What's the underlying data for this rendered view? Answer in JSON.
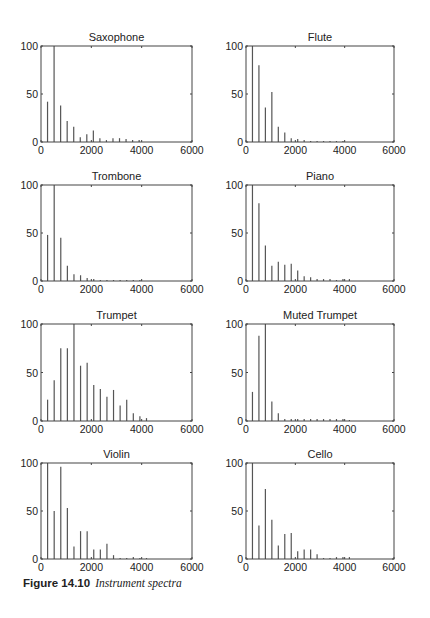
{
  "figure": {
    "caption_number": "Figure 14.10",
    "caption_text": "Instrument spectra"
  },
  "chart_data": [
    {
      "type": "bar",
      "title": "Saxophone",
      "xlabel": "",
      "ylabel": "",
      "xlim": [
        0,
        6000
      ],
      "ylim": [
        0,
        100
      ],
      "xticks": [
        0,
        2000,
        4000,
        6000
      ],
      "yticks": [
        0,
        50,
        100
      ],
      "grid": false,
      "x": [
        260,
        520,
        780,
        1040,
        1300,
        1560,
        1820,
        2080,
        2340,
        2600,
        2860,
        3120,
        3380,
        3640,
        3900
      ],
      "values": [
        42,
        100,
        38,
        22,
        16,
        5,
        8,
        12,
        4,
        2,
        4,
        4,
        3,
        2,
        2
      ]
    },
    {
      "type": "bar",
      "title": "Flute",
      "xlabel": "",
      "ylabel": "",
      "xlim": [
        0,
        6000
      ],
      "ylim": [
        0,
        100
      ],
      "xticks": [
        0,
        2000,
        4000,
        6000
      ],
      "yticks": [
        0,
        50,
        100
      ],
      "grid": false,
      "x": [
        262,
        524,
        786,
        1048,
        1310,
        1572,
        1834,
        2096,
        2358,
        2620,
        2882,
        3144,
        3406,
        3668,
        3930
      ],
      "values": [
        100,
        80,
        36,
        52,
        16,
        10,
        4,
        3,
        2,
        1,
        1,
        1,
        1,
        1,
        1
      ]
    },
    {
      "type": "bar",
      "title": "Trombone",
      "xlabel": "",
      "ylabel": "",
      "xlim": [
        0,
        6000
      ],
      "ylim": [
        0,
        100
      ],
      "xticks": [
        0,
        2000,
        4000,
        6000
      ],
      "yticks": [
        0,
        50,
        100
      ],
      "grid": false,
      "x": [
        262,
        524,
        786,
        1048,
        1310,
        1572,
        1834,
        2096,
        2358,
        2620,
        2882,
        3144,
        3406,
        3668,
        3930
      ],
      "values": [
        48,
        100,
        45,
        16,
        7,
        6,
        3,
        2,
        1,
        1,
        1,
        1,
        1,
        1,
        1
      ]
    },
    {
      "type": "bar",
      "title": "Piano",
      "xlabel": "",
      "ylabel": "",
      "xlim": [
        0,
        6000
      ],
      "ylim": [
        0,
        100
      ],
      "xticks": [
        0,
        2000,
        4000,
        6000
      ],
      "yticks": [
        0,
        50,
        100
      ],
      "grid": false,
      "x": [
        262,
        524,
        786,
        1048,
        1310,
        1572,
        1834,
        2096,
        2358,
        2620,
        2882,
        3144,
        3406,
        3668,
        3930,
        4192
      ],
      "values": [
        100,
        81,
        37,
        16,
        20,
        17,
        18,
        11,
        5,
        4,
        2,
        2,
        2,
        1,
        2,
        2
      ]
    },
    {
      "type": "bar",
      "title": "Trumpet",
      "xlabel": "",
      "ylabel": "",
      "xlim": [
        0,
        6000
      ],
      "ylim": [
        0,
        100
      ],
      "xticks": [
        0,
        2000,
        4000,
        6000
      ],
      "yticks": [
        0,
        50,
        100
      ],
      "grid": false,
      "x": [
        262,
        524,
        786,
        1048,
        1310,
        1572,
        1834,
        2096,
        2358,
        2620,
        2882,
        3144,
        3406,
        3668,
        3930,
        4192
      ],
      "values": [
        22,
        42,
        75,
        75,
        100,
        57,
        60,
        37,
        33,
        25,
        32,
        16,
        22,
        8,
        5,
        3
      ]
    },
    {
      "type": "bar",
      "title": "Muted Trumpet",
      "xlabel": "",
      "ylabel": "",
      "xlim": [
        0,
        6000
      ],
      "ylim": [
        0,
        100
      ],
      "xticks": [
        0,
        2000,
        4000,
        6000
      ],
      "yticks": [
        0,
        50,
        100
      ],
      "grid": false,
      "x": [
        262,
        524,
        786,
        1048,
        1310,
        1572,
        1834,
        2096,
        2358,
        2620,
        2882,
        3144,
        3406,
        3668,
        3930,
        4192
      ],
      "values": [
        30,
        88,
        100,
        20,
        8,
        2,
        2,
        2,
        2,
        2,
        2,
        2,
        2,
        2,
        2,
        1
      ]
    },
    {
      "type": "bar",
      "title": "Violin",
      "xlabel": "",
      "ylabel": "",
      "xlim": [
        0,
        6000
      ],
      "ylim": [
        0,
        100
      ],
      "xticks": [
        0,
        2000,
        4000,
        6000
      ],
      "yticks": [
        0,
        50,
        100
      ],
      "grid": false,
      "x": [
        262,
        524,
        786,
        1048,
        1310,
        1572,
        1834,
        2096,
        2358,
        2620,
        2882,
        3144,
        3406,
        3668,
        3930,
        4192
      ],
      "values": [
        100,
        50,
        96,
        53,
        13,
        29,
        29,
        10,
        10,
        16,
        4,
        1,
        1,
        2,
        1,
        1
      ]
    },
    {
      "type": "bar",
      "title": "Cello",
      "xlabel": "",
      "ylabel": "",
      "xlim": [
        0,
        6000
      ],
      "ylim": [
        0,
        100
      ],
      "xticks": [
        0,
        2000,
        4000,
        6000
      ],
      "yticks": [
        0,
        50,
        100
      ],
      "grid": false,
      "x": [
        262,
        524,
        786,
        1048,
        1310,
        1572,
        1834,
        2096,
        2358,
        2620,
        2882,
        3144,
        3406,
        3668,
        3930,
        4192
      ],
      "values": [
        100,
        35,
        73,
        41,
        14,
        26,
        27,
        8,
        10,
        10,
        5,
        1,
        1,
        2,
        2,
        2
      ]
    }
  ],
  "style": {
    "axis_color": "#444444",
    "stem_color": "#555555",
    "text_color": "#222222"
  }
}
